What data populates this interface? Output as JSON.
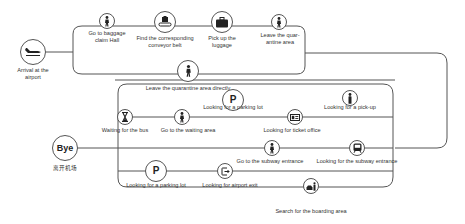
{
  "diagram": {
    "start": {
      "label": "Arrival at the airport",
      "icon": "airplane-icon"
    },
    "end": {
      "badge": "Bye",
      "sublabel": "离开机场"
    },
    "top_route": [
      {
        "label": "Go to baggage claim Hall",
        "icon": "walking-person-icon"
      },
      {
        "label": "Find the corresponding conveyor belt",
        "icon": "conveyor-belt-icon"
      },
      {
        "label": "Pick up the luggage",
        "icon": "suitcase-icon"
      },
      {
        "label": "Leave the quar- antine area",
        "icon": "walking-person-icon"
      }
    ],
    "direct_exit": {
      "label": "Leave the quarantine area directly",
      "icon": "walking-person-icon"
    },
    "inner_routes": {
      "row1": [
        {
          "label": "Looking for a parking lot",
          "icon": "parking-icon",
          "glyph": "P"
        },
        {
          "label": "Looking for a pick-up",
          "icon": "person-standing-icon"
        }
      ],
      "row2": [
        {
          "label": "Waiting for the bus",
          "icon": "hourglass-icon"
        },
        {
          "label": "Go to the waiting area",
          "icon": "walking-person-icon"
        },
        {
          "label": "Looking for ticket office",
          "icon": "ticket-icon"
        }
      ],
      "row3": [
        {
          "label": "Go to the subway entrance",
          "icon": "walking-person-icon"
        },
        {
          "label": "Looking for the subway entrance",
          "icon": "subway-train-icon"
        }
      ],
      "row4": [
        {
          "label": "Looking for a parking lot",
          "icon": "parking-icon",
          "glyph": "P"
        },
        {
          "label": "Looking for airport exit",
          "icon": "exit-icon"
        }
      ],
      "bottom": {
        "label": "Search for the boarding area",
        "icon": "taxi-person-icon"
      }
    },
    "colors": {
      "line": "#555555",
      "text": "#333333",
      "background": "#ffffff"
    }
  }
}
